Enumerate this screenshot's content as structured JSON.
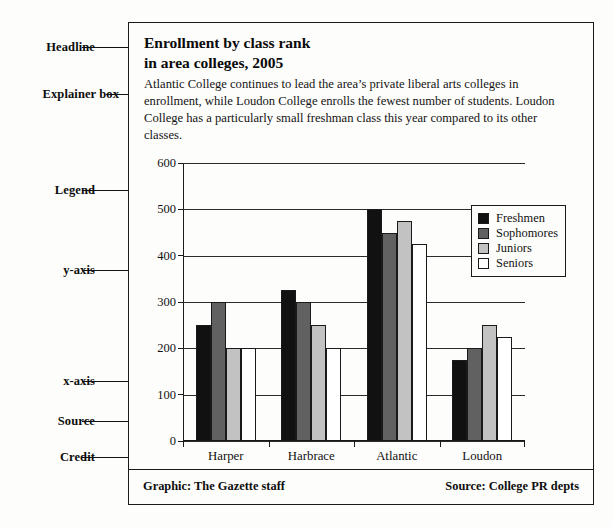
{
  "annotations": [
    {
      "label": "Headline"
    },
    {
      "label": "Explainer box"
    },
    {
      "label": "Legend"
    },
    {
      "label": "y-axis"
    },
    {
      "label": "x-axis"
    },
    {
      "label": "Source"
    },
    {
      "label": "Credit"
    }
  ],
  "graphic": {
    "headline_line1": "Enrollment by class rank",
    "headline_line2": "in area colleges, 2005",
    "explainer": "Atlantic College continues to lead the area’s private liberal arts colleges in enrollment, while Loudon College enrolls the fewest number of students. Loudon College has a particularly small freshman class this year compared to its other classes.",
    "credit": "Graphic: The Gazette staff",
    "source": "Source: College PR depts"
  },
  "chart_data": {
    "type": "bar",
    "title": "Enrollment by class rank in area colleges, 2005",
    "xlabel": "",
    "ylabel": "",
    "categories": [
      "Harper",
      "Harbrace",
      "Atlantic",
      "Loudon"
    ],
    "series": [
      {
        "name": "Freshmen",
        "color": "#111111",
        "values": [
          250,
          325,
          500,
          175
        ]
      },
      {
        "name": "Sophomores",
        "color": "#616161",
        "values": [
          300,
          300,
          450,
          200
        ]
      },
      {
        "name": "Juniors",
        "color": "#c2c2c2",
        "values": [
          200,
          250,
          475,
          250
        ]
      },
      {
        "name": "Seniors",
        "color": "#ffffff",
        "values": [
          200,
          200,
          425,
          225
        ]
      }
    ],
    "ylim": [
      0,
      600
    ],
    "yticks": [
      600,
      500,
      400,
      300,
      200,
      100,
      0
    ],
    "grid": true,
    "legend_position": "right-inside"
  }
}
